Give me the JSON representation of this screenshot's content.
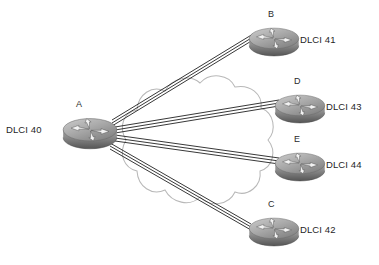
{
  "diagram": {
    "type": "frame-relay-hub-and-spoke",
    "background": "#ffffff",
    "cloud": {
      "name": "frame-relay-cloud",
      "stroke": "#b6b6b6",
      "fill": "none"
    },
    "link_color": "#1a1a1a",
    "nodes": [
      {
        "id": "A",
        "name": "router-a",
        "letter": "A",
        "dlci": "DLCI 40",
        "letter_pos": {
          "x": 76,
          "y": 99
        },
        "dlci_pos": {
          "x": 6,
          "y": 124
        },
        "icon_pos": {
          "x": 62,
          "y": 113
        },
        "icon_w": 56,
        "icon_h": 38
      },
      {
        "id": "B",
        "name": "router-b",
        "letter": "B",
        "dlci": "DLCI 41",
        "letter_pos": {
          "x": 268,
          "y": 9
        },
        "dlci_pos": {
          "x": 300,
          "y": 34
        },
        "icon_pos": {
          "x": 248,
          "y": 23
        },
        "icon_w": 52,
        "icon_h": 35
      },
      {
        "id": "D",
        "name": "router-d",
        "letter": "D",
        "dlci": "DLCI 43",
        "letter_pos": {
          "x": 294,
          "y": 76
        },
        "dlci_pos": {
          "x": 326,
          "y": 101
        },
        "icon_pos": {
          "x": 274,
          "y": 90
        },
        "icon_w": 52,
        "icon_h": 35
      },
      {
        "id": "E",
        "name": "router-e",
        "letter": "E",
        "dlci": "DLCI 44",
        "letter_pos": {
          "x": 294,
          "y": 134
        },
        "dlci_pos": {
          "x": 326,
          "y": 159
        },
        "icon_pos": {
          "x": 274,
          "y": 148
        },
        "icon_w": 52,
        "icon_h": 35
      },
      {
        "id": "C",
        "name": "router-c",
        "letter": "C",
        "dlci": "DLCI 42",
        "letter_pos": {
          "x": 268,
          "y": 199
        },
        "dlci_pos": {
          "x": 300,
          "y": 224
        },
        "icon_pos": {
          "x": 248,
          "y": 213
        },
        "icon_w": 52,
        "icon_h": 35
      }
    ],
    "links": [
      {
        "name": "link-a-b",
        "from": "A",
        "to": "B"
      },
      {
        "name": "link-a-d",
        "from": "A",
        "to": "D"
      },
      {
        "name": "link-a-e",
        "from": "A",
        "to": "E"
      },
      {
        "name": "link-a-c",
        "from": "A",
        "to": "C"
      }
    ]
  }
}
